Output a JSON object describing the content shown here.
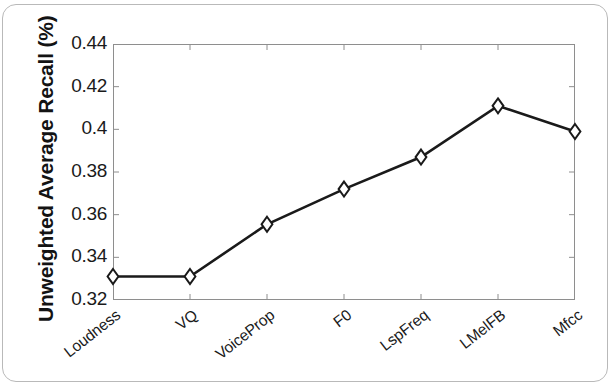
{
  "figure": {
    "frame_color": "#b9b9b9",
    "background": "#ffffff"
  },
  "chart_data": {
    "type": "line",
    "title": "",
    "subtitle": "",
    "xlabel": "",
    "ylabel": "Unweighted Average Recall (%)",
    "categories": [
      "Loudness",
      "VQ",
      "VoiceProp",
      "F0",
      "LspFreq",
      "LMelFB",
      "Mfcc"
    ],
    "values": [
      0.331,
      0.331,
      0.3555,
      0.372,
      0.387,
      0.411,
      0.399
    ],
    "series": [
      {
        "name": "Unweighted Average Recall",
        "values": [
          0.331,
          0.331,
          0.3555,
          0.372,
          0.387,
          0.411,
          0.399
        ]
      }
    ],
    "ylim": [
      0.32,
      0.44
    ],
    "yticks": [
      0.32,
      0.34,
      0.36,
      0.38,
      0.4,
      0.42,
      0.44
    ],
    "ytick_labels": [
      "0.32",
      "0.34",
      "0.36",
      "0.38",
      "0.4",
      "0.42",
      "0.44"
    ],
    "xtick_labels": [
      "Loudness",
      "VQ",
      "VoiceProp",
      "F0",
      "LspFreq",
      "LMelFB",
      "Mfcc"
    ],
    "grid": false,
    "legend": null,
    "legend_position": "none",
    "line_color": "#1a1a1a",
    "marker": "diamond",
    "marker_face_color": "#ffffff",
    "marker_edge_color": "#1a1a1a",
    "annotations": []
  }
}
